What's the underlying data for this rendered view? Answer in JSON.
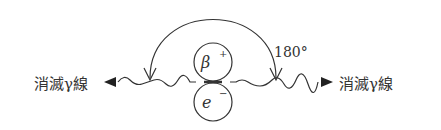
{
  "diagram": {
    "left_label": "消滅γ線",
    "right_label": "消滅γ線",
    "angle_label": "180°",
    "particle_top": {
      "symbol": "β",
      "charge": "+"
    },
    "particle_bottom": {
      "symbol": "e",
      "charge": "−"
    },
    "line_color": "#333333"
  }
}
